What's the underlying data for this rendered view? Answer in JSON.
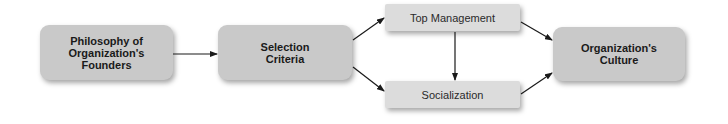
{
  "diagram": {
    "nodes": [
      {
        "id": "founders",
        "label": "Philosophy of\nOrganization's\nFounders"
      },
      {
        "id": "selection",
        "label": "Selection\nCriteria"
      },
      {
        "id": "top_management",
        "label": "Top Management"
      },
      {
        "id": "socialization",
        "label": "Socialization"
      },
      {
        "id": "culture",
        "label": "Organization's\nCulture"
      }
    ],
    "edges": [
      {
        "from": "founders",
        "to": "selection"
      },
      {
        "from": "selection",
        "to": "top_management"
      },
      {
        "from": "selection",
        "to": "socialization"
      },
      {
        "from": "top_management",
        "to": "socialization"
      },
      {
        "from": "top_management",
        "to": "culture"
      },
      {
        "from": "socialization",
        "to": "culture"
      }
    ],
    "colors": {
      "major_box": "#c9c9c9",
      "minor_box": "#dcdcdc",
      "arrow": "#1a1a1a"
    }
  }
}
